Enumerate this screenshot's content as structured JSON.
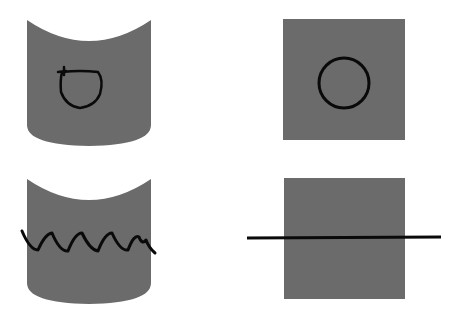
{
  "figure": {
    "width": 460,
    "height": 320,
    "background": "#ffffff",
    "fill_color": "#6b6b6b",
    "stroke_color": "#0a0a0a",
    "panels": [
      {
        "id": "top-left",
        "shape": "cylinder",
        "mark": "scribbled-circle"
      },
      {
        "id": "top-right",
        "shape": "square",
        "mark": "circle"
      },
      {
        "id": "bottom-left",
        "shape": "cylinder",
        "mark": "zigzag-line"
      },
      {
        "id": "bottom-right",
        "shape": "square",
        "mark": "straight-line"
      }
    ]
  }
}
